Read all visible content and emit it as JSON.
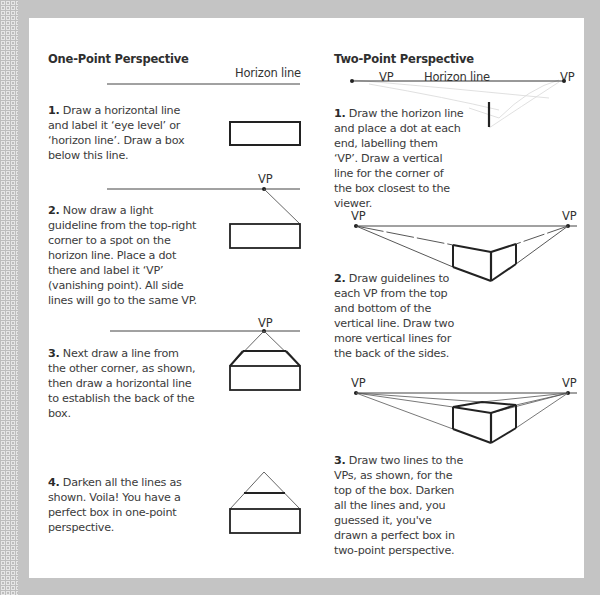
{
  "frame": {
    "background": "#c4c4c4",
    "page_background": "#ffffff",
    "text_color": "#3a3a3a"
  },
  "one_point": {
    "title": "One-Point Perspective",
    "horizon_label": "Horizon line",
    "vp_label": "VP",
    "steps": [
      {
        "number": "1.",
        "text": " Draw a horizontal line and label it ‘eye level’ or ‘horizon line’. Draw a box below this line."
      },
      {
        "number": "2.",
        "text": " Now draw a light guideline from the top-right corner to a spot on the horizon line. Place a dot there and label it ‘VP’ (vanishing point). All side lines will go to the same VP."
      },
      {
        "number": "3.",
        "text": " Next draw a line from the other corner, as shown, then draw a horizontal line to establish the back of the box."
      },
      {
        "number": "4.",
        "text": " Darken all the lines as shown. Voila! You have a perfect box in one-point perspective."
      }
    ]
  },
  "two_point": {
    "title": "Two-Point Perspective",
    "horizon_label": "Horizon line",
    "vp_left_label": "VP",
    "vp_right_label": "VP",
    "steps": [
      {
        "number": "1.",
        "text": " Draw the horizon line and place a dot at each end, labelling them ‘VP’. Draw a vertical line for the corner of the box closest to the viewer."
      },
      {
        "number": "2.",
        "text": " Draw guidelines to each VP from the top and bottom of the vertical line. Draw two more vertical lines for the back of the sides."
      },
      {
        "number": "3.",
        "text": " Draw two lines to the VPs, as shown, for the top of the box. Darken all the lines and, you guessed it, you've drawn a perfect box in two-point perspective."
      }
    ]
  }
}
